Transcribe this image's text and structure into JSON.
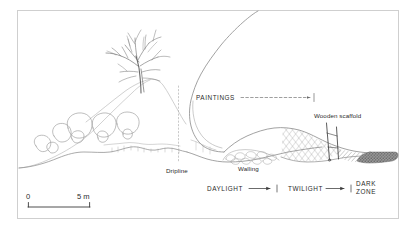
{
  "figure": {
    "kind": "archaeological-cave-cross-section",
    "frame_color": "#cfcfcf",
    "ink_color": "#5a5a5a",
    "text_color": "#2b2b2b",
    "background": "#ffffff"
  },
  "labels": {
    "paintings": "PAINTINGS",
    "wooden_scaffold": "Wooden scaffold",
    "dripline": "Dripline",
    "walling": "Walling",
    "daylight": "DAYLIGHT",
    "twilight": "TWILIGHT",
    "dark_zone_line1": "DARK",
    "dark_zone_line2": "ZONE"
  },
  "scale_bar": {
    "start_label": "0",
    "end_label": "5 m",
    "length_m": 5
  },
  "zones": [
    {
      "name": "DAYLIGHT",
      "order": 1
    },
    {
      "name": "TWILIGHT",
      "order": 2
    },
    {
      "name": "DARK ZONE",
      "order": 3
    }
  ],
  "features": [
    {
      "name": "tree",
      "description": "bare branching tree on slope above cave mouth"
    },
    {
      "name": "boulders",
      "description": "scree boulders along the left hillslope"
    },
    {
      "name": "cave-roof",
      "description": "rock overhang descending from upper right"
    },
    {
      "name": "dripline",
      "description": "vertical dotted line at the cave drip edge"
    },
    {
      "name": "walling",
      "description": "dry-stone walling inside the entrance"
    },
    {
      "name": "painted-passage",
      "description": "cross-hatched decorated passage"
    },
    {
      "name": "wooden-scaffold",
      "description": "vertical scaffold posts in the passage"
    },
    {
      "name": "dark-zone-fill",
      "description": "dark stippled deep passage to the right"
    }
  ]
}
